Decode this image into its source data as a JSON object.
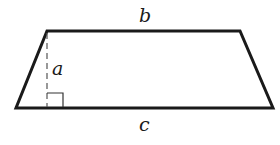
{
  "figure": {
    "shape": "trapezoid",
    "labels": {
      "top_base": "b",
      "height": "a",
      "bottom_base": "c"
    },
    "colors": {
      "stroke": "#1a1a1a",
      "dashed": "#555555",
      "background": "#ffffff"
    }
  }
}
